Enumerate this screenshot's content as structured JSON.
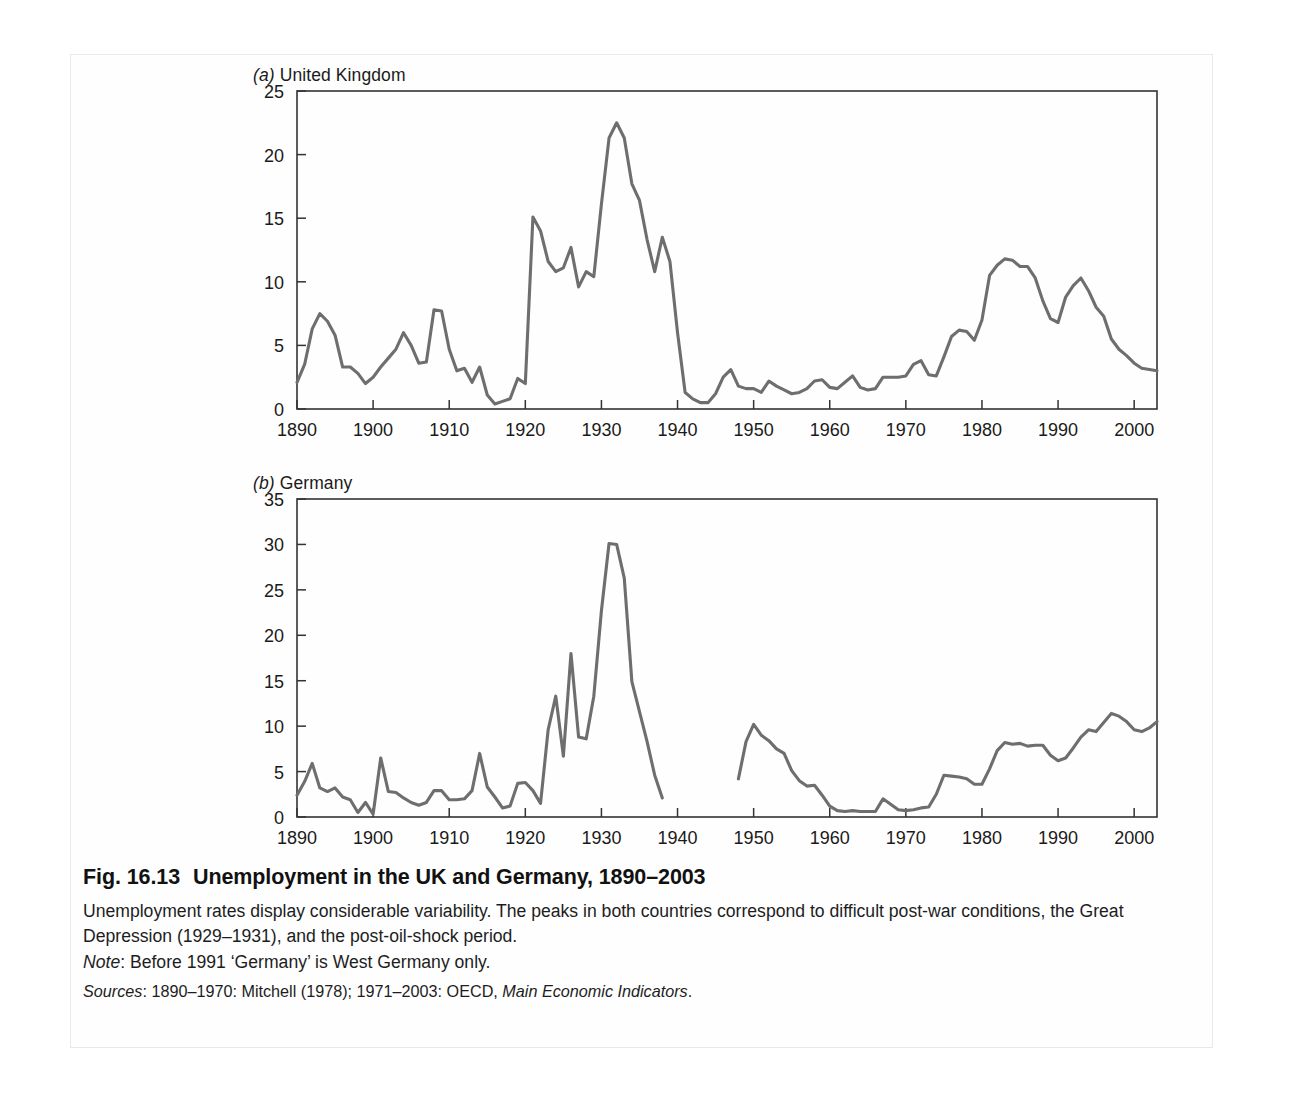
{
  "figure": {
    "label": "Fig. 16.13",
    "title": "Unemployment in the UK and Germany, 1890–2003",
    "caption": "Unemployment rates display considerable variability. The peaks in both countries correspond to difficult post-war conditions, the Great Depression (1929–1931), and the post-oil-shock period.",
    "note_label": "Note",
    "note_text": ": Before 1991 ‘Germany’ is West Germany only.",
    "sources_label": "Sources",
    "sources_text_a": ": 1890–1970: Mitchell (1978); 1971–2003: OECD, ",
    "sources_italic": "Main Economic Indicators",
    "sources_text_b": "."
  },
  "style": {
    "line_color": "#6e6e6e",
    "axis_color": "#333333",
    "text_color": "#1a1a1a",
    "page_background": "#ffffff",
    "frame_border": "#e9e9e9"
  },
  "chart_data": [
    {
      "id": "uk",
      "type": "line",
      "panel_letter": "(a)",
      "panel_name": "United Kingdom",
      "title": "(a) United Kingdom",
      "xlabel": "",
      "ylabel": "",
      "xlim": [
        1890,
        2003
      ],
      "ylim": [
        0,
        25
      ],
      "yticks": [
        0,
        5,
        10,
        15,
        20,
        25
      ],
      "xticks": [
        1890,
        1900,
        1910,
        1920,
        1930,
        1940,
        1950,
        1960,
        1970,
        1980,
        1990,
        2000
      ],
      "xtick_labels": [
        "1890",
        "1900",
        "1910",
        "1920",
        "1930",
        "1940",
        "1950",
        "1960",
        "1970",
        "1980",
        "1990",
        "2000"
      ],
      "ytick_labels": [
        "0",
        "5",
        "10",
        "15",
        "20",
        "25"
      ],
      "grid": false,
      "legend": "none",
      "series": [
        {
          "name": "UK unemployment rate (%)",
          "x": [
            1890,
            1891,
            1892,
            1893,
            1894,
            1895,
            1896,
            1897,
            1898,
            1899,
            1900,
            1901,
            1902,
            1903,
            1904,
            1905,
            1906,
            1907,
            1908,
            1909,
            1910,
            1911,
            1912,
            1913,
            1914,
            1915,
            1916,
            1917,
            1918,
            1919,
            1920,
            1921,
            1922,
            1923,
            1924,
            1925,
            1926,
            1927,
            1928,
            1929,
            1930,
            1931,
            1932,
            1933,
            1934,
            1935,
            1936,
            1937,
            1938,
            1939,
            1940,
            1941,
            1942,
            1943,
            1944,
            1945,
            1946,
            1947,
            1948,
            1949,
            1950,
            1951,
            1952,
            1953,
            1954,
            1955,
            1956,
            1957,
            1958,
            1959,
            1960,
            1961,
            1962,
            1963,
            1964,
            1965,
            1966,
            1967,
            1968,
            1969,
            1970,
            1971,
            1972,
            1973,
            1974,
            1975,
            1976,
            1977,
            1978,
            1979,
            1980,
            1981,
            1982,
            1983,
            1984,
            1985,
            1986,
            1987,
            1988,
            1989,
            1990,
            1991,
            1992,
            1993,
            1994,
            1995,
            1996,
            1997,
            1998,
            1999,
            2000,
            2001,
            2002,
            2003
          ],
          "y": [
            2.1,
            3.5,
            6.3,
            7.5,
            6.9,
            5.8,
            3.3,
            3.3,
            2.8,
            2.0,
            2.5,
            3.3,
            4.0,
            4.7,
            6.0,
            5.0,
            3.6,
            3.7,
            7.8,
            7.7,
            4.7,
            3.0,
            3.2,
            2.1,
            3.3,
            1.1,
            0.4,
            0.6,
            0.8,
            2.4,
            2.0,
            15.1,
            14.0,
            11.6,
            10.8,
            11.1,
            12.7,
            9.6,
            10.8,
            10.4,
            16.1,
            21.3,
            22.5,
            21.3,
            17.7,
            16.4,
            13.3,
            10.8,
            13.5,
            11.6,
            6.0,
            1.3,
            0.8,
            0.5,
            0.5,
            1.2,
            2.5,
            3.1,
            1.8,
            1.6,
            1.6,
            1.3,
            2.2,
            1.8,
            1.5,
            1.2,
            1.3,
            1.6,
            2.2,
            2.3,
            1.7,
            1.6,
            2.1,
            2.6,
            1.7,
            1.5,
            1.6,
            2.5,
            2.5,
            2.5,
            2.6,
            3.5,
            3.8,
            2.7,
            2.6,
            4.1,
            5.7,
            6.2,
            6.1,
            5.4,
            7.0,
            10.5,
            11.3,
            11.8,
            11.7,
            11.2,
            11.2,
            10.3,
            8.5,
            7.1,
            6.8,
            8.8,
            9.7,
            10.3,
            9.3,
            8.0,
            7.3,
            5.5,
            4.7,
            4.2,
            3.6,
            3.2,
            3.1,
            3.0
          ]
        }
      ]
    },
    {
      "id": "germany",
      "type": "line",
      "panel_letter": "(b)",
      "panel_name": "Germany",
      "title": "(b) Germany",
      "xlabel": "",
      "ylabel": "",
      "xlim": [
        1890,
        2003
      ],
      "ylim": [
        0,
        35
      ],
      "yticks": [
        0,
        5,
        10,
        15,
        20,
        25,
        30,
        35
      ],
      "xticks": [
        1890,
        1900,
        1910,
        1920,
        1930,
        1940,
        1950,
        1960,
        1970,
        1980,
        1990,
        2000
      ],
      "xtick_labels": [
        "1890",
        "1900",
        "1910",
        "1920",
        "1930",
        "1940",
        "1950",
        "1960",
        "1970",
        "1980",
        "1990",
        "2000"
      ],
      "ytick_labels": [
        "0",
        "5",
        "10",
        "15",
        "20",
        "25",
        "30",
        "35"
      ],
      "grid": false,
      "legend": "none",
      "data_gap": [
        1939,
        1948
      ],
      "series": [
        {
          "name": "Germany unemployment rate (%) — segment 1",
          "x": [
            1890,
            1891,
            1892,
            1893,
            1894,
            1895,
            1896,
            1897,
            1898,
            1899,
            1900,
            1901,
            1902,
            1903,
            1904,
            1905,
            1906,
            1907,
            1908,
            1909,
            1910,
            1911,
            1912,
            1913,
            1914,
            1915,
            1916,
            1917,
            1918,
            1919,
            1920,
            1921,
            1922,
            1923,
            1924,
            1925,
            1926,
            1927,
            1928,
            1929,
            1930,
            1931,
            1932,
            1933,
            1934,
            1935,
            1936,
            1937,
            1938
          ],
          "y": [
            2.4,
            3.9,
            5.9,
            3.2,
            2.8,
            3.2,
            2.2,
            1.9,
            0.5,
            1.6,
            0.3,
            6.5,
            2.8,
            2.7,
            2.1,
            1.6,
            1.3,
            1.6,
            2.9,
            2.9,
            1.9,
            1.9,
            2.0,
            2.9,
            7.0,
            3.3,
            2.2,
            1.0,
            1.2,
            3.7,
            3.8,
            2.9,
            1.5,
            9.6,
            13.3,
            6.7,
            18.0,
            8.8,
            8.6,
            13.3,
            22.7,
            30.1,
            30.0,
            26.3,
            14.9,
            11.6,
            8.3,
            4.6,
            2.1
          ]
        },
        {
          "name": "Germany unemployment rate (%) — segment 2",
          "x": [
            1948,
            1949,
            1950,
            1951,
            1952,
            1953,
            1954,
            1955,
            1956,
            1957,
            1958,
            1959,
            1960,
            1961,
            1962,
            1963,
            1964,
            1965,
            1966,
            1967,
            1968,
            1969,
            1970,
            1971,
            1972,
            1973,
            1974,
            1975,
            1976,
            1977,
            1978,
            1979,
            1980,
            1981,
            1982,
            1983,
            1984,
            1985,
            1986,
            1987,
            1988,
            1989,
            1990,
            1991,
            1992,
            1993,
            1994,
            1995,
            1996,
            1997,
            1998,
            1999,
            2000,
            2001,
            2002,
            2003
          ],
          "y": [
            4.2,
            8.3,
            10.2,
            9.0,
            8.4,
            7.5,
            7.0,
            5.1,
            4.0,
            3.4,
            3.5,
            2.4,
            1.2,
            0.7,
            0.6,
            0.7,
            0.6,
            0.6,
            0.6,
            2.0,
            1.4,
            0.8,
            0.7,
            0.8,
            1.0,
            1.1,
            2.5,
            4.6,
            4.5,
            4.4,
            4.2,
            3.6,
            3.6,
            5.3,
            7.3,
            8.2,
            8.0,
            8.1,
            7.8,
            7.9,
            7.9,
            6.8,
            6.2,
            6.5,
            7.6,
            8.8,
            9.6,
            9.4,
            10.4,
            11.4,
            11.1,
            10.5,
            9.6,
            9.4,
            9.8,
            10.5
          ]
        }
      ]
    }
  ]
}
